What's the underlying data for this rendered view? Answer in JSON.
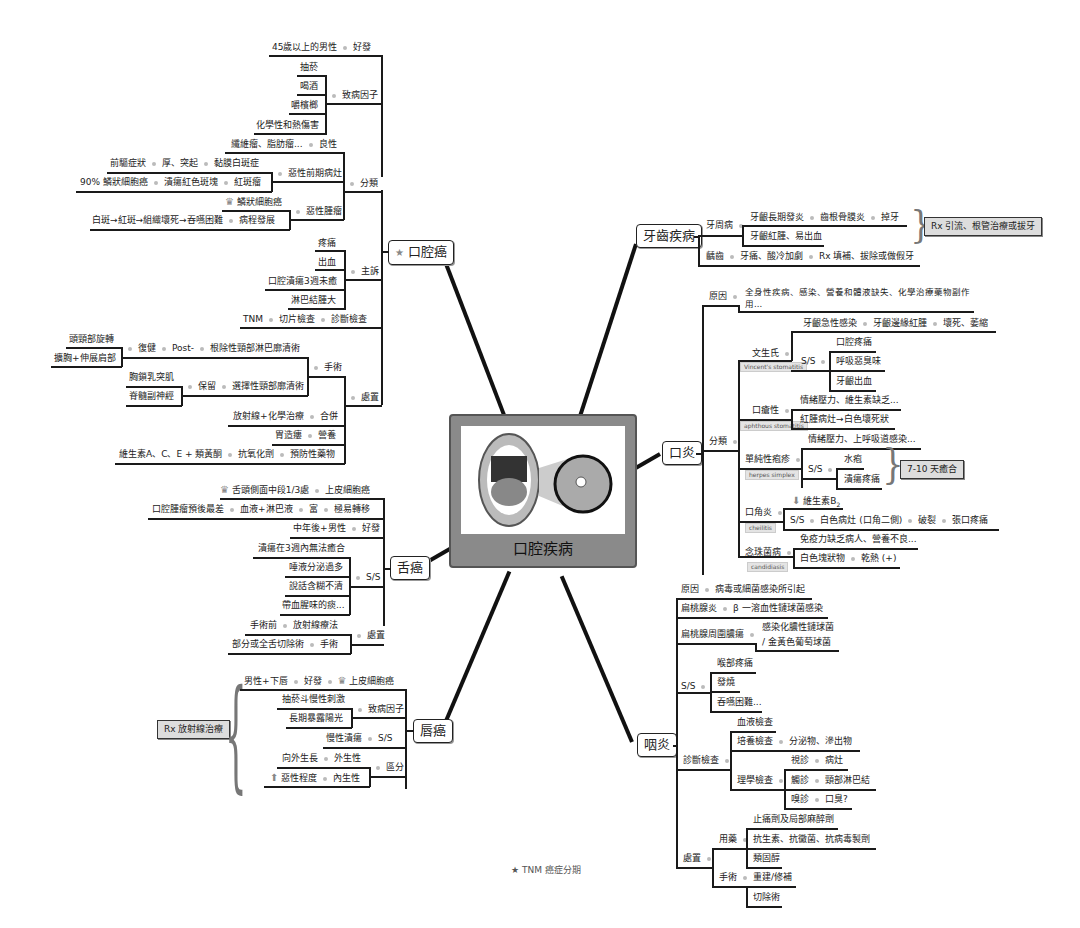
{
  "center": {
    "title": "口腔疾病",
    "image": "open-mouth-with-lesion-illustration"
  },
  "legend": {
    "text": "★ TNM 癌症分期"
  },
  "oral_cancer": {
    "title": "口腔癌",
    "high_risk": {
      "label": "好發",
      "value": "45歲以上的男性"
    },
    "causes": {
      "label": "致病因子",
      "items": [
        "抽菸",
        "喝酒",
        "嚼檳榔",
        "化學性和熱傷害"
      ]
    },
    "classification": {
      "label": "分類",
      "benign": {
        "label": "良性",
        "value": "纖維瘤、脂肪瘤..."
      },
      "premalignant": {
        "label": "惡性前期病灶",
        "leukoplakia": {
          "label": "黏膜白斑症",
          "a": "厚、突起",
          "b": "前驅症狀"
        },
        "erythroplakia": {
          "label": "紅斑瘤",
          "a": "潰瘍紅色斑塊",
          "b": "90% 鱗狀細胞癌"
        }
      },
      "malignant": {
        "label": "惡性腫瘤",
        "scc": "鱗狀細胞癌",
        "progress": {
          "label": "病程發展",
          "value": "白斑→紅斑→組織壞死→吞嚥困難"
        }
      }
    },
    "complaints": {
      "label": "主訴",
      "items": [
        "疼痛",
        "出血",
        "口腔潰瘍3週未癒",
        "淋巴結腫大"
      ]
    },
    "diagnosis": {
      "label": "診斷檢查",
      "a": "切片檢查",
      "b": "TNM"
    },
    "treatment": {
      "label": "處置",
      "surgery": {
        "label": "手術",
        "radical": {
          "label": "根除性頸部淋巴廓清術",
          "post": "Post-",
          "rehab": "復健",
          "items": [
            "頭頸部旋轉",
            "擴胸+伸展肩部"
          ]
        },
        "selective": {
          "label": "選擇性頸部廓清術",
          "keep": "保留",
          "items": [
            "胸鎖乳突肌",
            "脊髓副神經"
          ]
        }
      },
      "combined": {
        "label": "合併",
        "value": "放射線+化學治療"
      },
      "nutrition": {
        "label": "營養",
        "value": "胃造瘻"
      },
      "prevention": {
        "label": "預防性藥物",
        "a": "抗氧化劑",
        "b": "維生素A、C、E + 類黃酮"
      }
    }
  },
  "tongue_cancer": {
    "title": "舌癌",
    "type": {
      "label": "上皮細胞癌",
      "value": "舌頭側面中段1/3處"
    },
    "metastasis": {
      "label": "極易轉移",
      "a": "富",
      "b": "血液+淋巴液",
      "c": "口腔腫瘤預後最差"
    },
    "risk": {
      "label": "好發",
      "value": "中年後+男性"
    },
    "ss": {
      "label": "S/S",
      "items": [
        "潰瘍在3週內無法癒合",
        "唾液分泌過多",
        "說話含糊不清",
        "帶血腥味的痰..."
      ]
    },
    "treatment": {
      "label": "處置",
      "pre": {
        "label": "放射線療法",
        "value": "手術前"
      },
      "surgery": {
        "label": "手術",
        "value": "部分或全舌切除術"
      }
    }
  },
  "lip_cancer": {
    "title": "唇癌",
    "rx": "Rx 放射線治療",
    "risk": {
      "a": "男性+下唇",
      "b": "好發",
      "c": "上皮細胞癌"
    },
    "causes": {
      "label": "致病因子",
      "items": [
        "抽菸斗慢性刺激",
        "長期暴露陽光"
      ]
    },
    "ss": {
      "label": "S/S",
      "value": "慢性潰瘍"
    },
    "types": {
      "label": "區分",
      "ext": {
        "label": "外生性",
        "value": "向外生長"
      },
      "int": {
        "label": "內生性",
        "value": "惡性程度"
      }
    }
  },
  "dental": {
    "title": "牙齒疾病",
    "perio": {
      "label": "牙周病",
      "a": "牙齦長期發炎",
      "b": "齒根骨膜炎",
      "c": "掉牙",
      "d": "牙齦紅腫、易出血"
    },
    "rx": "Rx 引流、根管治療或拔牙",
    "caries": {
      "label": "齲齒",
      "a": "牙痛、酸冷加劇",
      "b": "Rx 填補、拔除或做假牙"
    }
  },
  "stomatitis": {
    "title": "口炎",
    "cause": {
      "label": "原因",
      "value": "全身性疾病、感染、營養和體液缺失、化學治療藥物副作用..."
    },
    "classification": {
      "label": "分類",
      "vincent": {
        "label": "文生氏",
        "tag": "Vincent's stomatitis",
        "a": "牙齦急性感染",
        "b": "牙齦邊緣紅腫",
        "c": "壞死、萎縮",
        "ss": "S/S",
        "items": [
          "口腔疼痛",
          "呼吸惡臭味",
          "牙齦出血"
        ]
      },
      "aphthous": {
        "label": "口瘡性",
        "tag": "aphthous stomatitis",
        "items": [
          "情緒壓力、維生素缺乏...",
          "紅腫病灶→白色壞死狀"
        ]
      },
      "herpes": {
        "label": "單純性疱疹",
        "tag": "herpes simplex",
        "cause": "情緒壓力、上呼吸道感染...",
        "ss": "S/S",
        "items": [
          "水疱",
          "潰瘍疼痛"
        ],
        "heal": "7-10 天癒合"
      },
      "cheilitis": {
        "label": "口角炎",
        "tag": "cheilitis",
        "vit": "維生素B",
        "sub": "2",
        "ss": "S/S",
        "a": "白色病灶 (口角二側)",
        "b": "破裂",
        "c": "張口疼痛"
      },
      "candida": {
        "label": "念珠菌病",
        "tag": "candidiasis",
        "cause": "免疫力缺乏病人、營養不良...",
        "a": "白色塊狀物",
        "b": "乾熱 (+)"
      }
    }
  },
  "pharyngitis": {
    "title": "咽炎",
    "cause": {
      "label": "原因",
      "value": "病毒或細菌感染所引起"
    },
    "tonsillitis": {
      "label": "扁桃腺炎",
      "value": "β 一溶血性鏈球菌感染"
    },
    "abscess": {
      "label": "扁桃腺周圍膿瘍",
      "v1": "感染化膿性鏈球菌",
      "v2": "/ 金黃色葡萄球菌"
    },
    "ss": {
      "label": "S/S",
      "items": [
        "喉部疼痛",
        "發燒",
        "吞嚥困難..."
      ]
    },
    "diagnosis": {
      "label": "診斷檢查",
      "blood": "血液檢查",
      "culture": {
        "label": "培養檢查",
        "value": "分泌物、滲出物"
      },
      "physical": {
        "label": "理學檢查",
        "items": [
          {
            "a": "視診",
            "b": "病灶"
          },
          {
            "a": "觸診",
            "b": "頸部淋巴結"
          },
          {
            "a": "嗅診",
            "b": "口臭?"
          }
        ]
      }
    },
    "treatment": {
      "label": "處置",
      "meds": {
        "label": "用藥",
        "items": [
          "止痛劑及局部麻醉劑",
          "抗生素、抗黴菌、抗病毒製劑",
          "類固醇"
        ]
      },
      "surgery": {
        "label": "手術",
        "items": [
          "重建/修補",
          "切除術"
        ]
      }
    }
  }
}
